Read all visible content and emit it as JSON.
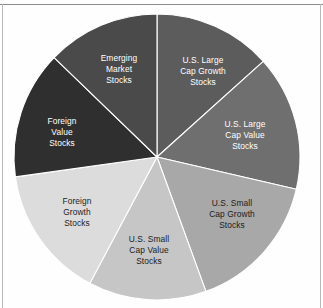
{
  "figure": {
    "name": "asset-allocation-pie-chart",
    "background_color": "#fefefe",
    "frame_line_color": "#8d8d8d",
    "center_x": 157,
    "center_y": 157,
    "radius": 143
  },
  "chart_data": {
    "type": "pie",
    "title": "",
    "subtitle": "",
    "xlabel": "",
    "ylabel": "",
    "grid": false,
    "legend_position": "none",
    "labels_inside_slices": true,
    "start_angle_deg": 0,
    "direction": "clockwise",
    "categories": [
      "U.S. Large Cap Growth Stocks",
      "U.S. Large Cap Value Stocks",
      "U.S. Small Cap Growth Stocks",
      "U.S. Small Cap Value Stocks",
      "Foreign Growth Stocks",
      "Foreign Value Stocks",
      "Emerging Market Stocks"
    ],
    "values": [
      48,
      55,
      57,
      48,
      54,
      52,
      46
    ],
    "value_unit": "degrees",
    "percentages": [
      13.3,
      15.3,
      15.8,
      13.3,
      15.0,
      14.4,
      12.8
    ],
    "colors": [
      "#5c5c5c",
      "#6f6f6f",
      "#a8a8a8",
      "#c6c6c6",
      "#dcdcdc",
      "#2f2f2f",
      "#4a4a4a"
    ],
    "label_colors": [
      "#ffffff",
      "#ffffff",
      "#1c1c1c",
      "#1c1c1c",
      "#1c1c1c",
      "#ffffff",
      "#ffffff"
    ],
    "slices": [
      {
        "name": "us-large-cap-growth",
        "label_lines": [
          "U.S. Large",
          "Cap Growth",
          "Stocks"
        ],
        "color": "#5c5c5c",
        "label_color": "#ffffff",
        "start_deg": 0,
        "end_deg": 48,
        "label_x": 203,
        "label_y": 72
      },
      {
        "name": "us-large-cap-value",
        "label_lines": [
          "U.S. Large",
          "Cap Value",
          "Stocks"
        ],
        "color": "#6f6f6f",
        "label_color": "#ffffff",
        "start_deg": 48,
        "end_deg": 103,
        "label_x": 245,
        "label_y": 136
      },
      {
        "name": "us-small-cap-growth",
        "label_lines": [
          "U.S. Small",
          "Cap Growth",
          "Stocks"
        ],
        "color": "#a8a8a8",
        "label_color": "#1c1c1c",
        "start_deg": 103,
        "end_deg": 160,
        "label_x": 232,
        "label_y": 215
      },
      {
        "name": "us-small-cap-value",
        "label_lines": [
          "U.S. Small",
          "Cap Value",
          "Stocks"
        ],
        "color": "#c6c6c6",
        "label_color": "#1c1c1c",
        "start_deg": 160,
        "end_deg": 208,
        "label_x": 149,
        "label_y": 251
      },
      {
        "name": "foreign-growth",
        "label_lines": [
          "Foreign",
          "Growth",
          "Stocks"
        ],
        "color": "#dcdcdc",
        "label_color": "#1c1c1c",
        "start_deg": 208,
        "end_deg": 262,
        "label_x": 77,
        "label_y": 213
      },
      {
        "name": "foreign-value",
        "label_lines": [
          "Foreign",
          "Value",
          "Stocks"
        ],
        "color": "#2f2f2f",
        "label_color": "#ffffff",
        "start_deg": 262,
        "end_deg": 314,
        "label_x": 62,
        "label_y": 133
      },
      {
        "name": "emerging-market",
        "label_lines": [
          "Emerging",
          "Market",
          "Stocks"
        ],
        "color": "#4a4a4a",
        "label_color": "#ffffff",
        "start_deg": 314,
        "end_deg": 360,
        "label_x": 119,
        "label_y": 70
      }
    ]
  }
}
